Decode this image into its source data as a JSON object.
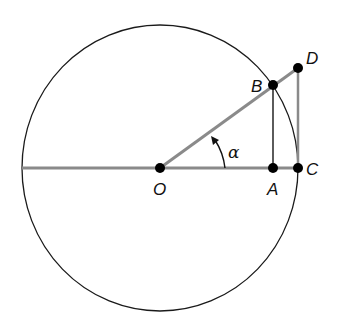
{
  "diagram": {
    "type": "unit-circle-trig",
    "colors": {
      "circle": "#1a1a1a",
      "thick_line": "#8a8a8a",
      "thin_line": "#333333",
      "point": "#000000"
    },
    "circle": {
      "cx": 160,
      "cy": 168,
      "rx": 138,
      "ry": 143
    },
    "points": {
      "O": {
        "label": "O",
        "x": 160,
        "y": 168
      },
      "A": {
        "label": "A",
        "x": 273,
        "y": 168
      },
      "C": {
        "label": "C",
        "x": 298,
        "y": 168
      },
      "B": {
        "label": "B",
        "x": 273,
        "y": 85
      },
      "D": {
        "label": "D",
        "x": 298,
        "y": 68
      }
    },
    "angle": {
      "label": "α"
    }
  }
}
